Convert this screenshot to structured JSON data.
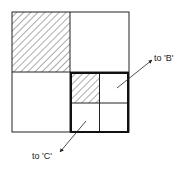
{
  "diagram": {
    "outer_square": {
      "x": 12,
      "y": 12,
      "size": 117
    },
    "shaded_quadrant": "top-left",
    "subdivided_quadrant": "bottom-right",
    "sub_shaded_quadrant": "top-left",
    "labels": {
      "to_b": "to 'B'",
      "to_c": "to 'C'"
    },
    "colors": {
      "line": "#222222",
      "hatch": "#555555",
      "background": "#ffffff"
    }
  }
}
